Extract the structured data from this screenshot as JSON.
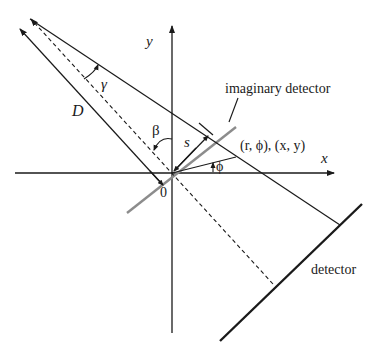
{
  "diagram": {
    "labels": {
      "y_axis": "y",
      "x_axis": "x",
      "origin": "0",
      "gamma": "γ",
      "beta": "β",
      "source_distance": "D",
      "detector_coord": "s",
      "point": "(r, ϕ), (x, y)",
      "phi": "ϕ",
      "imaginary_detector": "imaginary detector",
      "detector": "detector"
    },
    "colors": {
      "line": "#1a1a1a",
      "imaginary_detector": "#8c8c8c",
      "background": "#ffffff"
    }
  }
}
